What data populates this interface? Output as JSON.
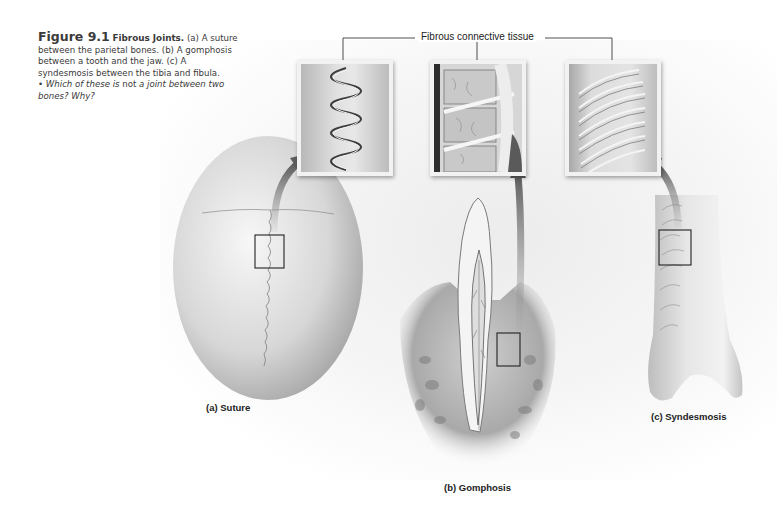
{
  "caption": {
    "figure_number": "Figure 9.1",
    "title": "Fibrous Joints.",
    "body": "(a) A suture between the parietal bones. (b) A gomphosis between a tooth and the jaw. (c) A syndesmosis between the tibia and fibula.",
    "question_bullet": "•",
    "question_part1": "Which of these is ",
    "question_emphasis": "not",
    "question_part2": " a joint between two bones? Why?"
  },
  "callout_label": "Fibrous connective tissue",
  "panels": [
    {
      "id": "a",
      "label": "(a)  Suture"
    },
    {
      "id": "b",
      "label": "(b)  Gomphosis"
    },
    {
      "id": "c",
      "label": "(c) Syndesmosis"
    }
  ],
  "colors": {
    "text": "#3a3a3a",
    "arrow": "#6e6e6e",
    "bone": "#d9d9d9",
    "leader_line": "#222222"
  }
}
